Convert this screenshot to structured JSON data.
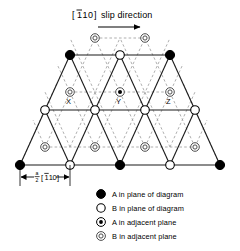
{
  "figure": {
    "title": {
      "direction_bracket_open": "[",
      "direction_index_1": "1",
      "direction_index_1_overbar": true,
      "direction_index_2": "1",
      "direction_index_3": "0",
      "direction_bracket_close": "]",
      "label": "slip direction",
      "full_text": "[110] slip direction",
      "arrow": "right-arrow"
    },
    "burgers_vector": {
      "fraction_numerator": "a",
      "fraction_denominator": "2",
      "bracket_open": "[",
      "index_1": "1",
      "index_1_overbar": true,
      "index_2": "1",
      "index_3": "0",
      "bracket_close": "]",
      "full_text": "a/2 [110]",
      "dimension_arrow": "double-headed-horizontal"
    },
    "site_labels": [
      {
        "text": "X",
        "x": 69,
        "y": 101
      },
      {
        "text": "Y",
        "x": 119,
        "y": 101
      },
      {
        "text": "Z",
        "x": 169,
        "y": 101
      }
    ],
    "legend": {
      "items": [
        {
          "marker": "filled-circle",
          "label": "A in plane of diagram"
        },
        {
          "marker": "open-circle",
          "label": "B in plane of diagram"
        },
        {
          "marker": "dot-in-circle",
          "label": "A in adjacent plane"
        },
        {
          "marker": "double-circle",
          "label": "B in adjacent plane"
        }
      ]
    },
    "colors": {
      "ink": "#000000",
      "solid_line": "#1a1a1a",
      "dashed_line": "#8a8a8a",
      "background": "#ffffff"
    },
    "lattice": {
      "description": "Close-packed triangular lattice, trapezoidal outline, 3 in-plane rows plus 3 interleaved adjacent-plane rows",
      "in_plane_rows": [
        {
          "row": 1,
          "y": 55,
          "nodes": [
            {
              "x": 70,
              "type": "filled-circle"
            },
            {
              "x": 120,
              "type": "open-circle"
            },
            {
              "x": 170,
              "type": "filled-circle"
            }
          ]
        },
        {
          "row": 2,
          "y": 110,
          "nodes": [
            {
              "x": 45,
              "type": "open-circle"
            },
            {
              "x": 95,
              "type": "open-circle"
            },
            {
              "x": 145,
              "type": "open-circle"
            },
            {
              "x": 195,
              "type": "open-circle"
            }
          ]
        },
        {
          "row": 3,
          "y": 165,
          "nodes": [
            {
              "x": 20,
              "type": "filled-circle"
            },
            {
              "x": 70,
              "type": "open-circle"
            },
            {
              "x": 120,
              "type": "filled-circle"
            },
            {
              "x": 170,
              "type": "open-circle"
            },
            {
              "x": 220,
              "type": "filled-circle"
            }
          ]
        }
      ],
      "adjacent_plane_rows": [
        {
          "row": 0,
          "y": 38,
          "nodes": [
            {
              "x": 95,
              "type": "double-circle"
            },
            {
              "x": 145,
              "type": "double-circle"
            }
          ]
        },
        {
          "row": 1,
          "y": 92,
          "nodes": [
            {
              "x": 70,
              "type": "double-circle",
              "label": "X"
            },
            {
              "x": 120,
              "type": "dot-in-circle",
              "label": "Y"
            },
            {
              "x": 170,
              "type": "double-circle",
              "label": "Z"
            }
          ]
        },
        {
          "row": 2,
          "y": 147,
          "nodes": [
            {
              "x": 45,
              "type": "double-circle"
            },
            {
              "x": 95,
              "type": "double-circle"
            },
            {
              "x": 145,
              "type": "double-circle"
            },
            {
              "x": 195,
              "type": "double-circle"
            }
          ]
        }
      ]
    }
  }
}
